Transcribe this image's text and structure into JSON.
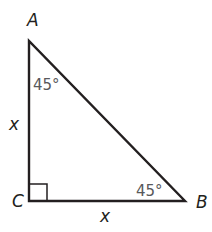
{
  "figure": {
    "type": "right isosceles triangle",
    "colors": {
      "stroke": "#231f20",
      "angle_text": "#58595b",
      "background": "#ffffff"
    },
    "vertices": [
      {
        "id": "A",
        "label": "A",
        "x": 29,
        "y": 41,
        "label_x": 27,
        "label_y": 26
      },
      {
        "id": "C",
        "label": "C",
        "x": 29,
        "y": 201,
        "label_x": 12,
        "label_y": 207
      },
      {
        "id": "B",
        "label": "B",
        "x": 185,
        "y": 201,
        "label_x": 196,
        "label_y": 208
      }
    ],
    "sides": [
      {
        "id": "AC",
        "label": "x",
        "label_x": 12,
        "label_y": 128
      },
      {
        "id": "CB",
        "label": "x",
        "label_x": 101,
        "label_y": 222
      },
      {
        "id": "AB",
        "label": ""
      }
    ],
    "angles": [
      {
        "vertex": "A",
        "label": "45°",
        "label_x": 33,
        "label_y": 90
      },
      {
        "vertex": "B",
        "label": "45°",
        "label_x": 136,
        "label_y": 196
      },
      {
        "vertex": "C",
        "label": "right angle",
        "marker": "square"
      }
    ]
  }
}
